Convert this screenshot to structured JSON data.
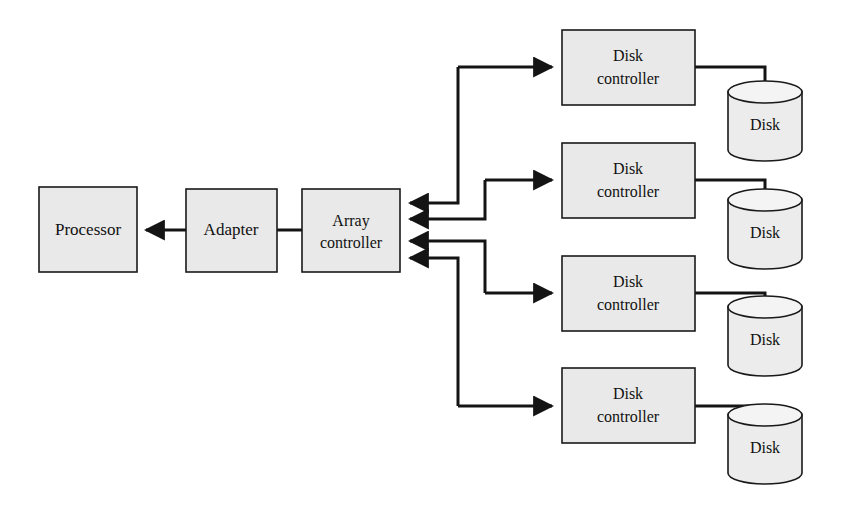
{
  "diagram": {
    "type": "block-diagram",
    "colors": {
      "box_fill": "#e9e9e9",
      "box_stroke": "#1a1a1a",
      "line": "#141414",
      "background": "#ffffff",
      "disk_fill": "#ececec"
    },
    "nodes": {
      "processor": {
        "label": "Processor",
        "x": 39,
        "y": 187,
        "w": 98,
        "h": 85
      },
      "adapter": {
        "label": "Adapter",
        "x": 186,
        "y": 189,
        "w": 91,
        "h": 83
      },
      "array_controller": {
        "label_line1": "Array",
        "label_line2": "controller",
        "x": 302,
        "y": 189,
        "w": 98,
        "h": 83
      },
      "disk_controllers": [
        {
          "label_line1": "Disk",
          "label_line2": "controller",
          "x": 562,
          "y": 30,
          "w": 133,
          "h": 75
        },
        {
          "label_line1": "Disk",
          "label_line2": "controller",
          "x": 562,
          "y": 143,
          "w": 133,
          "h": 75
        },
        {
          "label_line1": "Disk",
          "label_line2": "controller",
          "x": 562,
          "y": 256,
          "w": 133,
          "h": 75
        },
        {
          "label_line1": "Disk",
          "label_line2": "controller",
          "x": 562,
          "y": 368,
          "w": 133,
          "h": 75
        }
      ],
      "disks": [
        {
          "label": "Disk",
          "cx": 765,
          "top": 82,
          "w": 74,
          "h": 68
        },
        {
          "label": "Disk",
          "cx": 765,
          "top": 190,
          "w": 74,
          "h": 68
        },
        {
          "label": "Disk",
          "cx": 765,
          "top": 297,
          "w": 74,
          "h": 68
        },
        {
          "label": "Disk",
          "cx": 765,
          "top": 405,
          "w": 74,
          "h": 68
        }
      ]
    },
    "edges": [
      {
        "name": "adapter-to-processor",
        "from": "adapter",
        "to": "processor",
        "arrow": "left"
      },
      {
        "name": "adapter-to-array-controller",
        "from": "adapter",
        "to": "array_controller",
        "arrow": "none"
      },
      {
        "name": "array-controller-to-disk-controller-1",
        "from": "array_controller",
        "to": "disk_controller_1",
        "arrow": "both"
      },
      {
        "name": "array-controller-to-disk-controller-2",
        "from": "array_controller",
        "to": "disk_controller_2",
        "arrow": "both"
      },
      {
        "name": "array-controller-to-disk-controller-3",
        "from": "array_controller",
        "to": "disk_controller_3",
        "arrow": "both"
      },
      {
        "name": "array-controller-to-disk-controller-4",
        "from": "array_controller",
        "to": "disk_controller_4",
        "arrow": "both"
      },
      {
        "name": "disk-controller-1-to-disk-1",
        "from": "disk_controller_1",
        "to": "disk_1",
        "arrow": "none"
      },
      {
        "name": "disk-controller-2-to-disk-2",
        "from": "disk_controller_2",
        "to": "disk_2",
        "arrow": "none"
      },
      {
        "name": "disk-controller-3-to-disk-3",
        "from": "disk_controller_3",
        "to": "disk_3",
        "arrow": "none"
      },
      {
        "name": "disk-controller-4-to-disk-4",
        "from": "disk_controller_4",
        "to": "disk_4",
        "arrow": "none"
      }
    ]
  }
}
